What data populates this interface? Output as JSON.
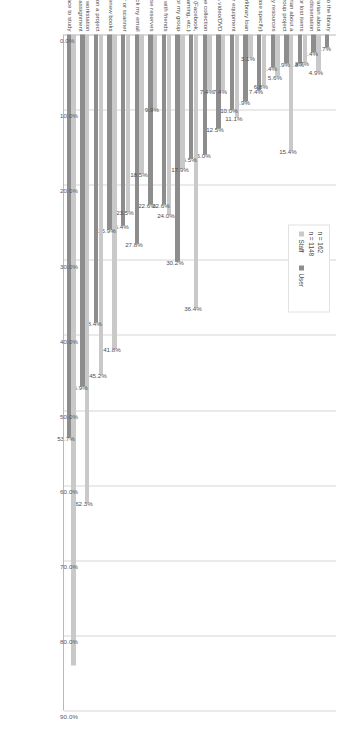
{
  "chart_data": {
    "type": "bar",
    "orientation": "horizontal",
    "title": "",
    "xlabel": "",
    "ylabel": "",
    "xlim": [
      0,
      90
    ],
    "xticks": [
      "0.0%",
      "10.0%",
      "20.0%",
      "30.0%",
      "40.0%",
      "50.0%",
      "60.0%",
      "70.0%",
      "80.0%",
      "90.0%"
    ],
    "xtick_values": [
      0,
      10,
      20,
      30,
      40,
      50,
      60,
      70,
      80,
      90
    ],
    "grid": true,
    "legend_position": "upper right",
    "categories": [
      "I don't come to the library",
      "Consult with a librarian about my thesis or dissertation",
      "Check on status of overdue fines or lost items",
      "Consult with a librarian about a class assignment or group project",
      "Take a class or workshop on library resources",
      "Other (please specify)",
      "Use interlibrary loan",
      "Check out a laptop or other equipment",
      "Watch a video/DVD",
      "Browse the collection",
      "Use a computer workstations for personal/social activities (Facebook, Twitter, web browsing, job searching, gaming, etc.)",
      "Get a study or media room for my group",
      "Get coffee/snacks and/or hang out with friends",
      "Use course reserves",
      "Check my email",
      "Use a copier or scanner",
      "Check out or renew books",
      "Collaborate with others on a project",
      "Use a computer workstation for a class assignment",
      "Comfortable, quiet place to study"
    ],
    "series": [
      {
        "name": "Staff",
        "color": "#c9c9c9",
        "n_label": "n = 162",
        "values": [
          0.0,
          4.9,
          3.7,
          15.4,
          5.6,
          6.8,
          3.1,
          11.1,
          7.4,
          7.4,
          36.4,
          17.9,
          24.0,
          9.9,
          18.5,
          23.5,
          41.8,
          45.2,
          62.3,
          84.0
        ],
        "labels": [
          "",
          "4.9%",
          "3.7%",
          "15.4%",
          "5.6%",
          "6.8%",
          "3.1%",
          "11.1%",
          "7.4%",
          "7.4%",
          "36.4%",
          "17.9%",
          "24.0%",
          "9.9%",
          "18.5%",
          "23.5%",
          "41.8%",
          "45.2%",
          "62.3%",
          ""
        ]
      },
      {
        "name": "User",
        "color": "#8d8d8d",
        "n_label": "n = 1148",
        "values": [
          1.7,
          2.4,
          3.8,
          3.9,
          4.4,
          7.4,
          8.9,
          10.0,
          12.5,
          16.0,
          16.5,
          30.2,
          22.6,
          22.6,
          27.8,
          25.4,
          25.9,
          38.4,
          46.9,
          53.7
        ],
        "labels": [
          "1.7%",
          "2.4%",
          "3.8%",
          "3.9%",
          "4.4%",
          "7.4%",
          "8.9%",
          "10.0%",
          "12.5%",
          "16.0%",
          "16.5%",
          "30.2%",
          "22.6%",
          "22.6%",
          "27.8%",
          "25.4%",
          "25.9%",
          "38.4%",
          "46.9%",
          "53.7%"
        ]
      }
    ],
    "annotations": {
      "staff_n": "n = 162",
      "user_n": "n = 1148"
    },
    "colors": {
      "staff": "#c9c9c9",
      "user": "#8d8d8d",
      "grid": "#d6d6d6",
      "axis": "#b9b9b9",
      "text": "#4a4a4a",
      "background": "#ffffff"
    }
  },
  "legend": {
    "staff_label": "Staff",
    "user_label": "User"
  }
}
